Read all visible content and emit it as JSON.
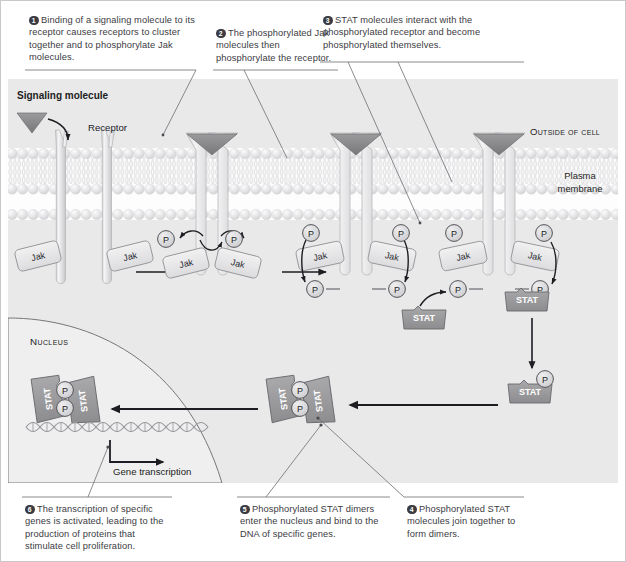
{
  "figure": {
    "background": "#ffffff",
    "cell_fill": "#e9e9ea",
    "nucleus_fill": "#efeff0",
    "ink": "#3b3b42",
    "stat_fill": "#9a9a9c",
    "jak_fill": "#e4e4e5",
    "phosphate_fill": "#d4d4d6",
    "receptor_fill": "#dedee0",
    "ligand_fill": "#8a8a8a"
  },
  "callouts": [
    {
      "num": "1",
      "text": "Binding of a signaling molecule to its receptor causes receptors to cluster together and to phosphorylate Jak molecules."
    },
    {
      "num": "2",
      "text": "The phosphorylated Jak molecules then phosphorylate the receptor."
    },
    {
      "num": "3",
      "text": "STAT molecules interact with the phosphorylated receptor and become phosphorylated themselves."
    },
    {
      "num": "4",
      "text": "Phosphorylated STAT molecules join together to form dimers."
    },
    {
      "num": "5",
      "text": "Phosphorylated STAT dimers enter the nucleus and bind to the DNA of specific genes."
    },
    {
      "num": "6",
      "text": "The transcription of specific genes is activated, leading to the production of proteins that stimulate cell proliferation."
    }
  ],
  "labels": {
    "signaling_molecule": "Signaling molecule",
    "receptor": "Receptor",
    "outside_of_cell": "Outside of cell",
    "plasma_membrane": "Plasma membrane",
    "nucleus": "Nucleus",
    "gene_transcription": "Gene transcription"
  },
  "molecules": {
    "jak": "Jak",
    "stat": "STAT",
    "phosphate": "P"
  },
  "stages": [
    {
      "id": "unbound-receptors",
      "jak_count": 2,
      "phosphate_count": 0,
      "ligand_bound": false
    },
    {
      "id": "clustered-phosphorylated-jak",
      "jak_count": 2,
      "phosphate_count": 2,
      "ligand_bound": true
    },
    {
      "id": "phosphorylated-receptor",
      "jak_count": 2,
      "phosphate_count": 4,
      "ligand_bound": true
    },
    {
      "id": "stat-docking",
      "jak_count": 2,
      "phosphate_count": 4,
      "ligand_bound": true,
      "stat_count": 2
    },
    {
      "id": "free-phospho-stat",
      "stat_count": 1,
      "phosphate_count": 1
    },
    {
      "id": "stat-dimer-cytoplasm",
      "stat_count": 2,
      "phosphate_count": 2
    },
    {
      "id": "stat-dimer-dna-bound",
      "stat_count": 2,
      "phosphate_count": 2
    }
  ]
}
